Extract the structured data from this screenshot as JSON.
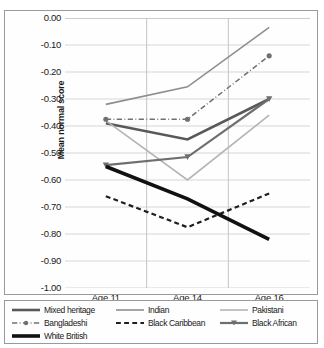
{
  "chart_data": {
    "type": "line",
    "title": "",
    "xlabel": "",
    "ylabel": "Mean normal score",
    "categories": [
      "Age 11",
      "Age 14",
      "Age 16"
    ],
    "ylim": [
      -1.0,
      0.0
    ],
    "ytick_labels": [
      "0.00",
      "-0.10",
      "-0.20",
      "-0.30",
      "-0.40",
      "-0.50",
      "-0.60",
      "-0.70",
      "-0.80",
      "-0.90",
      "-1.00"
    ],
    "ytick_values": [
      0.0,
      -0.1,
      -0.2,
      -0.3,
      -0.4,
      -0.5,
      -0.6,
      -0.7,
      -0.8,
      -0.9,
      -1.0
    ],
    "grid": true,
    "legend_position": "bottom",
    "series": [
      {
        "name": "Mixed heritage",
        "values": [
          -0.39,
          -0.45,
          -0.3
        ],
        "color": "#595959",
        "width": 2.6,
        "dash": "none",
        "marker": "none"
      },
      {
        "name": "Indian",
        "values": [
          -0.32,
          -0.255,
          -0.035
        ],
        "color": "#8e8e8e",
        "width": 1.6,
        "dash": "none",
        "marker": "none"
      },
      {
        "name": "Pakistani",
        "values": [
          -0.38,
          -0.6,
          -0.36
        ],
        "color": "#b4b4b4",
        "width": 1.6,
        "dash": "none",
        "marker": "none"
      },
      {
        "name": "Bangladeshi",
        "values": [
          -0.375,
          -0.375,
          -0.14
        ],
        "color": "#707070",
        "width": 1.5,
        "dash": "dashdot",
        "marker": "circle"
      },
      {
        "name": "Black Caribbean",
        "values": [
          -0.66,
          -0.775,
          -0.65
        ],
        "color": "#1f1f1f",
        "width": 2.2,
        "dash": "dashed",
        "marker": "none"
      },
      {
        "name": "Black African",
        "values": [
          -0.545,
          -0.515,
          -0.3
        ],
        "color": "#6e6e6e",
        "width": 2.2,
        "dash": "none",
        "marker": "triangle"
      },
      {
        "name": "White British",
        "values": [
          -0.55,
          -0.67,
          -0.82
        ],
        "color": "#111111",
        "width": 3.6,
        "dash": "none",
        "marker": "none"
      }
    ]
  },
  "legend": {
    "rows": [
      [
        "Mixed heritage",
        "Indian",
        "Pakistani"
      ],
      [
        "Bangladeshi",
        "Black Caribbean",
        "Black African"
      ],
      [
        "White British",
        "",
        ""
      ]
    ]
  }
}
